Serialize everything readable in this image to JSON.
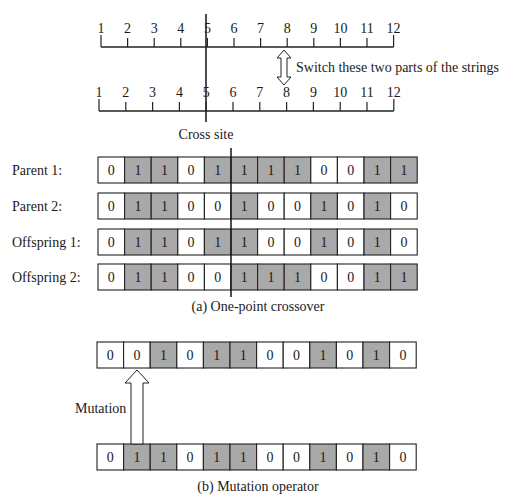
{
  "ruler": {
    "positions": [
      "1",
      "2",
      "3",
      "4",
      "5",
      "6",
      "7",
      "8",
      "9",
      "10",
      "11",
      "12"
    ],
    "switch_label": "Switch these two parts of the strings",
    "cross_site_label": "Cross site",
    "cross_after_position": 5
  },
  "crossover": {
    "rows": [
      {
        "label": "Parent 1:",
        "bits": [
          0,
          1,
          1,
          0,
          1,
          1,
          1,
          1,
          0,
          0,
          1,
          1
        ]
      },
      {
        "label": "Parent 2:",
        "bits": [
          0,
          1,
          1,
          0,
          0,
          1,
          0,
          0,
          1,
          0,
          1,
          0
        ]
      },
      {
        "label": "Offspring 1:",
        "bits": [
          0,
          1,
          1,
          0,
          1,
          1,
          0,
          0,
          1,
          0,
          1,
          0
        ]
      },
      {
        "label": "Offspring 2:",
        "bits": [
          0,
          1,
          1,
          0,
          0,
          1,
          1,
          1,
          0,
          0,
          1,
          1
        ]
      }
    ],
    "caption": "(a) One-point crossover"
  },
  "mutation": {
    "mutated_bits": [
      0,
      0,
      1,
      0,
      1,
      1,
      0,
      0,
      1,
      0,
      1,
      0
    ],
    "original_bits": [
      0,
      1,
      1,
      0,
      1,
      1,
      0,
      0,
      1,
      0,
      1,
      0
    ],
    "mutated_index": 1,
    "arrow_label": "Mutation",
    "caption": "(b) Mutation operator"
  },
  "colors": {
    "one_fill": "#a9a9a9",
    "zero_fill": "#ffffff",
    "stroke": "#222222"
  }
}
